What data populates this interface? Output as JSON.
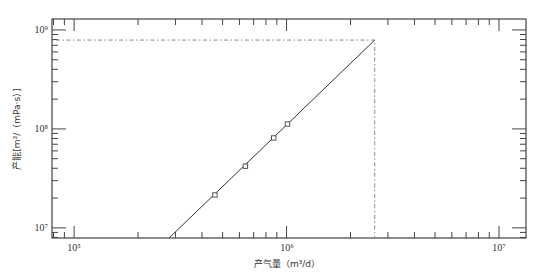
{
  "chart_data": {
    "type": "scatter",
    "title": "",
    "xlabel": "产气量（m³/d）",
    "ylabel": "产能[m²/（mPa·s）]",
    "xscale": "log",
    "yscale": "log",
    "xlim": [
      78700,
      13400000
    ],
    "ylim": [
      7900000,
      1290000000
    ],
    "grid": false,
    "legend": null,
    "x_ticks": [
      {
        "value": 100000,
        "label": "10⁵"
      },
      {
        "value": 1000000,
        "label": "10⁶"
      },
      {
        "value": 10000000,
        "label": "10⁷"
      }
    ],
    "y_ticks": [
      {
        "value": 10000000,
        "label": "10⁷"
      },
      {
        "value": 100000000,
        "label": "10⁸"
      },
      {
        "value": 1000000000,
        "label": "10⁹"
      }
    ],
    "series": [
      {
        "name": "measured points",
        "type": "scatter",
        "marker": "square",
        "x": [
          460000,
          640000,
          870000,
          1010000
        ],
        "y": [
          21500000,
          42000000,
          81000000,
          112000000
        ]
      },
      {
        "name": "fit line",
        "type": "line",
        "style": "solid",
        "x": [
          280000,
          2600000
        ],
        "y": [
          7900000,
          790000000
        ]
      },
      {
        "name": "reference lines",
        "type": "line",
        "style": "dotted",
        "x": [
          78700,
          2600000,
          2600000
        ],
        "y": [
          790000000,
          790000000,
          7900000
        ]
      }
    ],
    "annotations": []
  },
  "labels": {
    "x_title": "产气量（m³/d）",
    "y_title": "产能[m²/（mPa·s）]",
    "x_tick_1": "10⁵",
    "x_tick_2": "10⁶",
    "x_tick_3": "10⁷",
    "y_tick_1": "10⁷",
    "y_tick_2": "10⁸",
    "y_tick_3": "10⁹"
  },
  "colors": {
    "axis": "#444444",
    "line": "#333333",
    "dotted": "#777777",
    "marker": "#555555"
  }
}
